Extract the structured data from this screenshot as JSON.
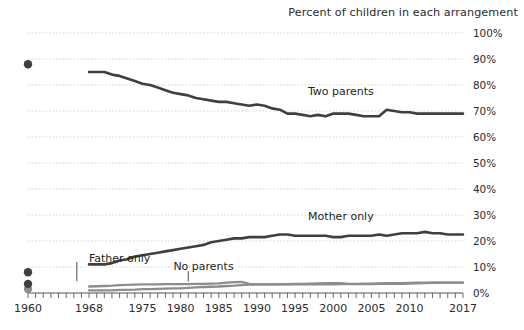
{
  "chart_data": {
    "type": "line",
    "title": "Percent of children in each arrangement",
    "xlabel": "",
    "ylabel": "",
    "xlim": [
      1960,
      2017
    ],
    "ylim": [
      0,
      100
    ],
    "grid": true,
    "legend_position": "inline-annotations",
    "y_ticks": [
      "0%",
      "10%",
      "20%",
      "30%",
      "40%",
      "50%",
      "60%",
      "70%",
      "80%",
      "90%",
      "100%"
    ],
    "y_tick_values": [
      0,
      10,
      20,
      30,
      40,
      50,
      60,
      70,
      80,
      90,
      100
    ],
    "x_ticks": [
      "1960",
      "1968",
      "1975",
      "1980",
      "1985",
      "1990",
      "1995",
      "2000",
      "2005",
      "2010",
      "2017"
    ],
    "x_tick_values": [
      1960,
      1968,
      1975,
      1980,
      1985,
      1990,
      1995,
      2000,
      2005,
      2010,
      2017
    ],
    "annotations": [
      {
        "label": "Two parents",
        "x": 2001,
        "y": 76
      },
      {
        "label": "Mother only",
        "x": 2001,
        "y": 28
      },
      {
        "label": "Father only",
        "x": 1972,
        "y": 12
      },
      {
        "label": "No parents",
        "x": 1983,
        "y": 9
      }
    ],
    "series": [
      {
        "name": "Two parents",
        "isolated_points": [
          {
            "x": 1960,
            "y": 88
          }
        ],
        "x": [
          1968,
          1969,
          1970,
          1971,
          1972,
          1973,
          1974,
          1975,
          1976,
          1977,
          1978,
          1979,
          1980,
          1981,
          1982,
          1983,
          1984,
          1985,
          1986,
          1987,
          1988,
          1989,
          1990,
          1991,
          1992,
          1993,
          1994,
          1995,
          1996,
          1997,
          1998,
          1999,
          2000,
          2001,
          2002,
          2003,
          2004,
          2005,
          2006,
          2007,
          2008,
          2009,
          2010,
          2011,
          2012,
          2013,
          2014,
          2015,
          2016,
          2017
        ],
        "values": [
          85,
          85,
          85,
          84,
          83.5,
          82.5,
          81.5,
          80.5,
          80,
          79,
          78,
          77,
          76.5,
          76,
          75,
          74.5,
          74,
          73.5,
          73.5,
          73,
          72.5,
          72,
          72.5,
          72,
          71,
          70.5,
          69,
          69,
          68.5,
          68,
          68.5,
          68,
          69,
          69,
          69,
          68.5,
          68,
          68,
          68,
          70.5,
          70,
          69.5,
          69.5,
          69,
          69,
          69,
          69,
          69,
          69,
          69
        ]
      },
      {
        "name": "Mother only",
        "isolated_points": [
          {
            "x": 1960,
            "y": 8
          }
        ],
        "x": [
          1968,
          1969,
          1970,
          1971,
          1972,
          1973,
          1974,
          1975,
          1976,
          1977,
          1978,
          1979,
          1980,
          1981,
          1982,
          1983,
          1984,
          1985,
          1986,
          1987,
          1988,
          1989,
          1990,
          1991,
          1992,
          1993,
          1994,
          1995,
          1996,
          1997,
          1998,
          1999,
          2000,
          2001,
          2002,
          2003,
          2004,
          2005,
          2006,
          2007,
          2008,
          2009,
          2010,
          2011,
          2012,
          2013,
          2014,
          2015,
          2016,
          2017
        ],
        "values": [
          11,
          11,
          11,
          11.5,
          12.5,
          13,
          14,
          14.5,
          15,
          15.5,
          16,
          16.5,
          17,
          17.5,
          18,
          18.5,
          19.5,
          20,
          20.5,
          21,
          21,
          21.5,
          21.5,
          21.5,
          22,
          22.5,
          22.5,
          22,
          22,
          22,
          22,
          22,
          21.5,
          21.5,
          22,
          22,
          22,
          22,
          22.5,
          22,
          22.5,
          23,
          23,
          23,
          23.5,
          23,
          23,
          22.5,
          22.5,
          22.5
        ]
      },
      {
        "name": "Father only",
        "isolated_points": [
          {
            "x": 1960,
            "y": 1.5
          }
        ],
        "x": [
          1968,
          1969,
          1970,
          1971,
          1972,
          1973,
          1974,
          1975,
          1976,
          1977,
          1978,
          1979,
          1980,
          1981,
          1982,
          1983,
          1984,
          1985,
          1986,
          1987,
          1988,
          1989,
          1990,
          1991,
          1992,
          1993,
          1994,
          1995,
          1996,
          1997,
          1998,
          1999,
          2000,
          2001,
          2002,
          2003,
          2004,
          2005,
          2006,
          2007,
          2008,
          2009,
          2010,
          2011,
          2012,
          2013,
          2014,
          2015,
          2016,
          2017
        ],
        "values": [
          1,
          1,
          1,
          1,
          1.2,
          1.2,
          1.3,
          1.5,
          1.5,
          1.6,
          1.7,
          1.8,
          1.8,
          2,
          2.2,
          2.3,
          2.4,
          2.5,
          2.7,
          2.8,
          3,
          3.2,
          3.2,
          3.3,
          3.3,
          3.3,
          3.4,
          3.5,
          3.5,
          3.6,
          3.7,
          3.8,
          3.8,
          3.8,
          3.5,
          3.5,
          3.6,
          3.6,
          3.7,
          3.8,
          3.8,
          3.8,
          3.9,
          4,
          4,
          4,
          4,
          4,
          4,
          4
        ]
      },
      {
        "name": "No parents",
        "isolated_points": [
          {
            "x": 1960,
            "y": 3.5
          }
        ],
        "x": [
          1968,
          1969,
          1970,
          1971,
          1972,
          1973,
          1974,
          1975,
          1976,
          1977,
          1978,
          1979,
          1980,
          1981,
          1982,
          1983,
          1984,
          1985,
          1986,
          1987,
          1988,
          1989,
          1990,
          1991,
          1992,
          1993,
          1994,
          1995,
          1996,
          1997,
          1998,
          1999,
          2000,
          2001,
          2002,
          2003,
          2004,
          2005,
          2006,
          2007,
          2008,
          2009,
          2010,
          2011,
          2012,
          2013,
          2014,
          2015,
          2016,
          2017
        ],
        "values": [
          2.5,
          2.6,
          2.7,
          2.8,
          3,
          3.1,
          3.2,
          3.3,
          3.3,
          3.3,
          3.4,
          3.4,
          3.4,
          3.4,
          3.5,
          3.5,
          3.6,
          3.7,
          4,
          4.2,
          4.3,
          3.5,
          3.4,
          3.3,
          3.3,
          3.3,
          3.3,
          3.3,
          3.3,
          3.3,
          3.3,
          3.3,
          3.3,
          3.4,
          3.4,
          3.4,
          3.4,
          3.4,
          3.5,
          3.5,
          3.5,
          3.5,
          3.6,
          3.7,
          3.8,
          3.9,
          4,
          4,
          4,
          4
        ]
      }
    ]
  },
  "colors": {
    "line_dark": "#3f3f3f",
    "line_light": "#8d8d8d",
    "grid": "#c9c9c9",
    "text": "#231f20"
  }
}
